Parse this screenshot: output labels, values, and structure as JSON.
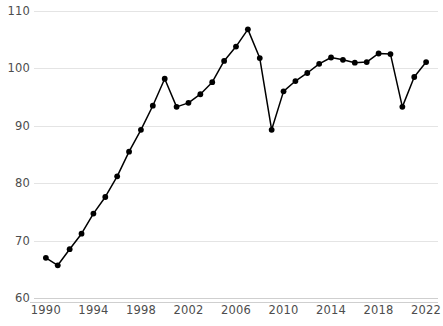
{
  "chart_data": {
    "type": "line",
    "title": "",
    "subtitle": "",
    "xlabel": "",
    "ylabel": "",
    "xlim": [
      1989,
      2023
    ],
    "ylim": [
      60,
      110
    ],
    "grid": true,
    "legend": null,
    "legend_position": "none",
    "line_color": "#000000",
    "marker_color": "#000000",
    "marker": "circle",
    "x_tick_labels": [
      "1990",
      "1994",
      "1998",
      "2002",
      "2006",
      "2010",
      "2014",
      "2018",
      "2022"
    ],
    "x_tick_values": [
      1990,
      1994,
      1998,
      2002,
      2006,
      2010,
      2014,
      2018,
      2022
    ],
    "y_tick_labels": [
      "60",
      "70",
      "80",
      "90",
      "100",
      "110"
    ],
    "y_tick_values": [
      60,
      70,
      80,
      90,
      100,
      110
    ],
    "x": [
      1990,
      1991,
      1992,
      1993,
      1994,
      1995,
      1996,
      1997,
      1998,
      1999,
      2000,
      2001,
      2002,
      2003,
      2004,
      2005,
      2006,
      2007,
      2008,
      2009,
      2010,
      2011,
      2012,
      2013,
      2014,
      2015,
      2016,
      2017,
      2018,
      2019,
      2020,
      2021,
      2022
    ],
    "values": [
      67.0,
      65.7,
      68.5,
      71.2,
      74.7,
      77.6,
      81.2,
      85.5,
      89.3,
      93.5,
      98.2,
      93.3,
      94.0,
      95.5,
      97.6,
      101.3,
      103.8,
      106.8,
      101.8,
      89.3,
      96.0,
      97.8,
      99.2,
      100.8,
      101.9,
      101.5,
      101.0,
      101.1,
      102.6,
      102.5,
      93.3,
      98.5,
      101.1
    ],
    "series": [
      {
        "name": "",
        "values": [
          67.0,
          65.7,
          68.5,
          71.2,
          74.7,
          77.6,
          81.2,
          85.5,
          89.3,
          93.5,
          98.2,
          93.3,
          94.0,
          95.5,
          97.6,
          101.3,
          103.8,
          106.8,
          101.8,
          89.3,
          96.0,
          97.8,
          99.2,
          100.8,
          101.9,
          101.5,
          101.0,
          101.1,
          102.6,
          102.5,
          93.3,
          98.5,
          101.1
        ]
      }
    ]
  }
}
